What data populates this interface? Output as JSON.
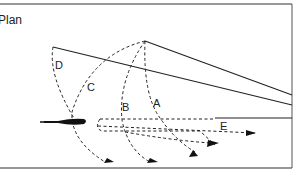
{
  "figure": {
    "title": "Plan",
    "labels": {
      "A": "A",
      "B": "B",
      "C": "C",
      "D": "D",
      "E": "E"
    },
    "colors": {
      "stroke": "#222222",
      "background": "#ffffff"
    }
  }
}
